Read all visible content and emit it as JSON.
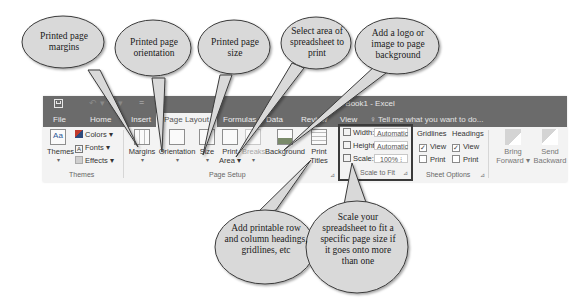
{
  "window": {
    "title": "Book1 - Excel",
    "qat": {
      "save_icon": "save-icon",
      "undo_icon": "undo-icon",
      "customize": "="
    }
  },
  "tabs": [
    {
      "label": "File"
    },
    {
      "label": "Home"
    },
    {
      "label": "Insert"
    },
    {
      "label": "Page Layout",
      "active": true
    },
    {
      "label": "Formulas"
    },
    {
      "label": "Data"
    },
    {
      "label": "Review"
    },
    {
      "label": "View"
    }
  ],
  "tell_me": "Tell me what you want to do...",
  "groups": {
    "themes": {
      "label": "Themes",
      "themes_button": "Themes",
      "colors": "Colors",
      "fonts": "Fonts",
      "effects": "Effects"
    },
    "page_setup": {
      "label": "Page Setup",
      "margins": "Margins",
      "orientation": "Orientation",
      "size": "Size",
      "print_area_1": "Print",
      "print_area_2": "Area",
      "breaks": "Breaks",
      "background": "Background",
      "print_titles_1": "Print",
      "print_titles_2": "Titles"
    },
    "scale_to_fit": {
      "label": "Scale to Fit",
      "width_label": "Width:",
      "width_value": "Automatic",
      "height_label": "Height:",
      "height_value": "Automatic",
      "scale_label": "Scale:",
      "scale_value": "100%"
    },
    "sheet_options": {
      "label": "Sheet Options",
      "gridlines": "Gridlines",
      "headings": "Headings",
      "view": "View",
      "print": "Print",
      "gridlines_view_checked": true,
      "gridlines_print_checked": false,
      "headings_view_checked": true,
      "headings_print_checked": false
    },
    "arrange": {
      "bring_forward_1": "Bring",
      "bring_forward_2": "Forward",
      "send_backward_1": "Send",
      "send_backward_2": "Backward"
    }
  },
  "callouts": [
    {
      "id": "margins",
      "text": "Printed page margins"
    },
    {
      "id": "orientation",
      "text": "Printed page orientation"
    },
    {
      "id": "size",
      "text": "Printed page size"
    },
    {
      "id": "print-area",
      "text": "Select area of spreadsheet to print"
    },
    {
      "id": "background",
      "text": "Add a logo or image to page background"
    },
    {
      "id": "print-titles",
      "text": "Add printable row and column headings, gridlines, etc"
    },
    {
      "id": "scale",
      "text": "Scale your spreadsheet to fit a specific page size if it goes onto more than one"
    }
  ],
  "colors": {
    "titlebar": "#6b6b6b",
    "ribbon": "#f3f3f3",
    "bubble_fill": "#d9d9d9",
    "bubble_stroke": "#3a3a3a"
  }
}
